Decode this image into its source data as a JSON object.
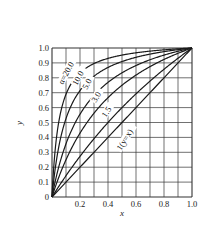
{
  "chart_data": {
    "type": "line",
    "title": "",
    "xlabel": "x",
    "ylabel": "y",
    "xlim": [
      0,
      1.0
    ],
    "ylim": [
      0,
      1.0
    ],
    "grid": true,
    "legend": "inline curve labels",
    "x_ticks": [
      "0.2",
      "0.4",
      "0.6",
      "0.8",
      "1.0"
    ],
    "y_ticks": [
      "0",
      "0.1",
      "0.2",
      "0.3",
      "0.4",
      "0.5",
      "0.6",
      "0.7",
      "0.8",
      "0.9",
      "1.0"
    ],
    "x": [
      0,
      0.1,
      0.2,
      0.3,
      0.4,
      0.5,
      0.6,
      0.7,
      0.8,
      0.9,
      1.0
    ],
    "series": [
      {
        "name": "1(y=x)",
        "alpha": 1.0,
        "values": [
          0,
          0.1,
          0.2,
          0.3,
          0.4,
          0.5,
          0.6,
          0.7,
          0.8,
          0.9,
          1.0
        ]
      },
      {
        "name": "1.5",
        "alpha": 1.5,
        "values": [
          0,
          0.143,
          0.273,
          0.391,
          0.5,
          0.6,
          0.692,
          0.778,
          0.857,
          0.931,
          1.0
        ]
      },
      {
        "name": "3.0",
        "alpha": 3.0,
        "values": [
          0,
          0.25,
          0.429,
          0.563,
          0.667,
          0.75,
          0.818,
          0.875,
          0.923,
          0.964,
          1.0
        ]
      },
      {
        "name": "5.0",
        "alpha": 5.0,
        "values": [
          0,
          0.357,
          0.556,
          0.682,
          0.769,
          0.833,
          0.882,
          0.921,
          0.952,
          0.978,
          1.0
        ]
      },
      {
        "name": "10.0",
        "alpha": 10.0,
        "values": [
          0,
          0.526,
          0.714,
          0.811,
          0.87,
          0.909,
          0.938,
          0.959,
          0.976,
          0.989,
          1.0
        ]
      },
      {
        "name": "α=20.0",
        "alpha": 20.0,
        "values": [
          0,
          0.69,
          0.833,
          0.896,
          0.93,
          0.952,
          0.968,
          0.979,
          0.988,
          0.994,
          1.0
        ]
      }
    ],
    "annotations": [
      "α=20.0",
      "10.0",
      "5.0",
      "3.0",
      "1.5",
      "1(y=x)"
    ]
  },
  "layout": {
    "plot_left": 52,
    "plot_top": 48,
    "plot_right": 192,
    "plot_bottom": 197,
    "line_color": "#1a1a1a",
    "grid_color": "#333333"
  }
}
